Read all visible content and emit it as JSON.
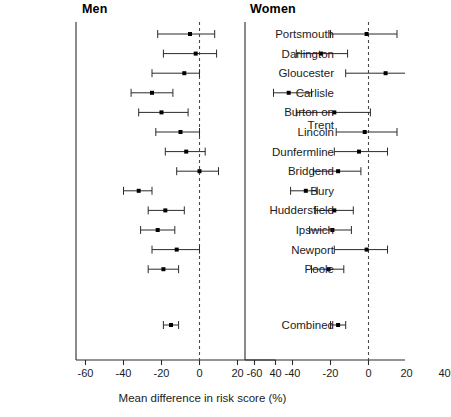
{
  "figure": {
    "xlabel": "Mean difference in risk score (%)",
    "panels": [
      {
        "key": "men",
        "label": "Men"
      },
      {
        "key": "women",
        "label": "Women"
      }
    ],
    "axis": {
      "ticks": [
        -60,
        -40,
        -20,
        0,
        20,
        40
      ],
      "tick_labels": [
        "-60",
        "-40",
        "-20",
        "0",
        "20",
        "40"
      ],
      "xlim": [
        -65,
        45
      ],
      "reference_line": 0,
      "reference_line_style": "dashed",
      "grid": false
    },
    "geometry": {
      "men_panel_x0": 76,
      "men_panel_x1": 228,
      "women_panel_x0": 245,
      "women_panel_x1": 397,
      "px_per_unit": 1.9,
      "panel_top": 22,
      "panel_bottom": 360,
      "row_spacing": 19.6,
      "first_row_y": 34,
      "combined_row_y": 325
    },
    "colors": {
      "line": "#2b2b2b",
      "marker": "#000000",
      "axis": "#2b2b2b",
      "reference": "#4a4a4a",
      "text": "#1b1b1b"
    }
  },
  "chart_data": {
    "type": "scatter",
    "subtype": "forest-plot",
    "title": "",
    "xlabel": "Mean difference in risk score (%)",
    "ylabel": "",
    "xlim": [
      -65,
      45
    ],
    "xticks": [
      -60,
      -40,
      -20,
      0,
      20,
      40
    ],
    "grid": false,
    "legend": "none",
    "reference_line": 0,
    "categories": [
      "Portsmouth",
      "Darlington",
      "Gloucester",
      "Carlisle",
      "Burton on Trent",
      "Lincoln",
      "Dunfermline",
      "Bridgend",
      "Bury",
      "Huddersfield",
      "Ipswich",
      "Newport",
      "Poole",
      "Combined"
    ],
    "category_display": [
      "Portsmouth",
      "Darlington",
      "Gloucester",
      "Carlisle",
      "Burton on\nTrent",
      "Lincoln",
      "Dunfermline",
      "Bridgend",
      "Bury",
      "Huddersfield",
      "Ipswich",
      "Newport",
      "Poole",
      "Combined"
    ],
    "series": [
      {
        "name": "Men",
        "values": [
          -5,
          -2,
          -8,
          -25,
          -20,
          -10,
          -7,
          0,
          -32,
          -18,
          -22,
          -12,
          -19,
          -15
        ],
        "ci_low": [
          -22,
          -19,
          -25,
          -36,
          -32,
          -23,
          -18,
          -12,
          -40,
          -27,
          -31,
          -25,
          -27,
          -19
        ],
        "ci_high": [
          8,
          9,
          0,
          -14,
          -6,
          0,
          3,
          10,
          -25,
          -8,
          -13,
          0,
          -11,
          -11
        ]
      },
      {
        "name": "Women",
        "values": [
          -1,
          -25,
          9,
          -42,
          -18,
          -2,
          -5,
          -16,
          -33,
          -18,
          -19,
          -1,
          -21,
          -16
        ],
        "ci_low": [
          -20,
          -38,
          -12,
          -50,
          -38,
          -17,
          -18,
          -29,
          -41,
          -28,
          -31,
          -18,
          -30,
          -20
        ],
        "ci_high": [
          15,
          -11,
          28,
          -30,
          1,
          15,
          10,
          -4,
          -27,
          -8,
          -9,
          10,
          -13,
          -12
        ]
      }
    ]
  }
}
